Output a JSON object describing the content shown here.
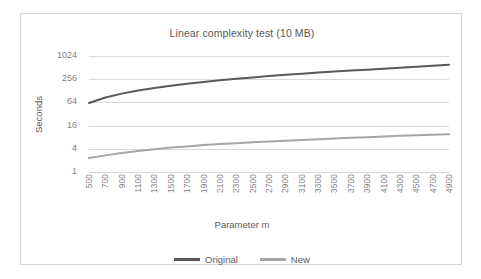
{
  "chart_data": {
    "type": "line",
    "title": "Linear complexity test (10 MB)",
    "xlabel": "Parameter m",
    "ylabel": "Seconds",
    "yscale": "log",
    "ylim": [
      1,
      1024
    ],
    "yticks": [
      "1",
      "4",
      "16",
      "64",
      "256",
      "1024"
    ],
    "ytick_values": [
      1,
      4,
      16,
      64,
      256,
      1024
    ],
    "grid": true,
    "legend_position": "bottom",
    "categories": [
      500,
      700,
      900,
      1100,
      1300,
      1500,
      1700,
      1900,
      2100,
      2300,
      2500,
      2700,
      2900,
      3100,
      3300,
      3500,
      3700,
      3900,
      4100,
      4300,
      4500,
      4700,
      4900
    ],
    "xtick_labels": [
      "500",
      "700",
      "900",
      "1100",
      "1300",
      "1500",
      "1700",
      "1900",
      "2100",
      "2300",
      "2500",
      "2700",
      "2900",
      "3100",
      "3300",
      "3500",
      "3700",
      "3900",
      "4100",
      "4300",
      "4500",
      "4700",
      "4900"
    ],
    "series": [
      {
        "name": "Original",
        "color": "#595959",
        "values": [
          62,
          86,
          108,
          130,
          152,
          174,
          196,
          218,
          240,
          262,
          285,
          308,
          332,
          356,
          380,
          404,
          428,
          452,
          478,
          508,
          538,
          572,
          608
        ]
      },
      {
        "name": "New",
        "color": "#a6a6a6",
        "values": [
          2.3,
          2.7,
          3.1,
          3.5,
          3.9,
          4.3,
          4.6,
          5.0,
          5.3,
          5.6,
          5.9,
          6.2,
          6.5,
          6.8,
          7.1,
          7.4,
          7.7,
          8.0,
          8.4,
          8.7,
          9.0,
          9.3,
          9.5
        ]
      }
    ]
  },
  "legend": {
    "entries": [
      {
        "label": "Original",
        "color": "#595959"
      },
      {
        "label": "New",
        "color": "#a6a6a6"
      }
    ]
  },
  "colors": {
    "original": "#595959",
    "new": "#a6a6a6",
    "grid": "#d9d9d9",
    "text": "#595959",
    "tick_text": "#7f7f7f",
    "border": "#d4d4d4"
  }
}
